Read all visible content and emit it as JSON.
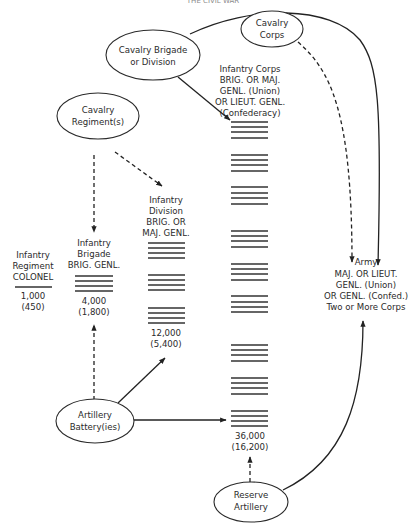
{
  "header": {
    "running_title": "THE CIVIL WAR"
  },
  "nodes": {
    "cavalry_corps": {
      "line1": "Cavalry",
      "line2": "Corps"
    },
    "cavalry_brigade": {
      "line1": "Cavalry Brigade",
      "line2": "or Division"
    },
    "cavalry_regiment": {
      "line1": "Cavalry",
      "line2": "Regiment(s)"
    },
    "artillery_battery": {
      "line1": "Artillery",
      "line2": "Battery(ies)"
    },
    "reserve_artillery": {
      "line1": "Reserve",
      "line2": "Artillery"
    }
  },
  "units": {
    "regiment": {
      "lines": [
        "Infantry",
        "Regiment",
        "COLONEL"
      ],
      "strength": "1,000",
      "effective": "(450)",
      "bars": 1
    },
    "brigade": {
      "lines": [
        "Infantry",
        "Brigade",
        "BRIG. GENL."
      ],
      "strength": "4,000",
      "effective": "(1,800)",
      "bars": 4
    },
    "division": {
      "lines": [
        "Infantry",
        "Division",
        "BRIG. OR",
        "MAJ. GENL."
      ],
      "strength": "12,000",
      "effective": "(5,400)",
      "bar_groups": 3
    },
    "corps": {
      "lines": [
        "Infantry Corps",
        "BRIG. OR MAJ.",
        "GENL. (Union)",
        "OR LIEUT. GENL.",
        "(Confederacy)"
      ],
      "strength": "36,000",
      "effective": "(16,200)",
      "bar_groups": 9
    },
    "army": {
      "lines": [
        "Army",
        "MAJ. OR LIEUT.",
        "GENL. (Union)",
        "OR GENL. (Confed.)",
        "Two or More Corps"
      ]
    }
  },
  "legend_colors": {
    "ink": "#222222",
    "background": "#ffffff"
  }
}
